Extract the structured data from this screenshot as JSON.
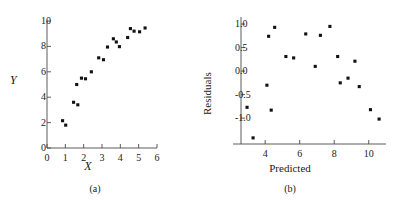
{
  "figure": {
    "background": "#ffffff",
    "marker_color": "#111111",
    "axis_color": "#4a4a4a"
  },
  "panels": [
    {
      "id": "a",
      "caption": "(a)",
      "chart_data": {
        "type": "scatter",
        "title": "",
        "xlabel": "X",
        "ylabel": "Y",
        "xlim": [
          0,
          6
        ],
        "ylim": [
          0,
          10
        ],
        "xticks": [
          0,
          1,
          2,
          3,
          4,
          5,
          6
        ],
        "xticklabels": [
          "0",
          "1",
          "2",
          "3",
          "4",
          "5",
          "6"
        ],
        "yticks": [
          0,
          2,
          4,
          6,
          8,
          10
        ],
        "yticklabels": [
          "0",
          "2",
          "4",
          "6",
          "8",
          "10"
        ],
        "grid": false,
        "legend": null,
        "points": [
          {
            "x": 0.85,
            "y": 2.15
          },
          {
            "x": 1.02,
            "y": 1.8
          },
          {
            "x": 1.45,
            "y": 3.6
          },
          {
            "x": 1.68,
            "y": 3.4
          },
          {
            "x": 1.62,
            "y": 5.0
          },
          {
            "x": 1.88,
            "y": 5.5
          },
          {
            "x": 2.1,
            "y": 5.45
          },
          {
            "x": 2.42,
            "y": 6.0
          },
          {
            "x": 2.82,
            "y": 7.1
          },
          {
            "x": 3.08,
            "y": 6.95
          },
          {
            "x": 3.3,
            "y": 7.95
          },
          {
            "x": 3.62,
            "y": 8.6
          },
          {
            "x": 3.78,
            "y": 8.35
          },
          {
            "x": 3.95,
            "y": 7.98
          },
          {
            "x": 4.4,
            "y": 8.7
          },
          {
            "x": 4.55,
            "y": 9.4
          },
          {
            "x": 4.75,
            "y": 9.2
          },
          {
            "x": 5.05,
            "y": 9.15
          },
          {
            "x": 5.35,
            "y": 9.45
          }
        ]
      }
    },
    {
      "id": "b",
      "caption": "(b)",
      "chart_data": {
        "type": "scatter",
        "title": "",
        "xlabel": "Predicted",
        "ylabel": "Residuals",
        "xlim": [
          2.6,
          11.0
        ],
        "ylim": [
          -1.55,
          1.15
        ],
        "xticks": [
          4,
          6,
          8,
          10
        ],
        "xticklabels": [
          "4",
          "6",
          "8",
          "10"
        ],
        "yticks": [
          -1.0,
          -0.5,
          0.0,
          0.5,
          1.0
        ],
        "yticklabels": [
          "-1.0",
          "-0.5",
          "0.0",
          "0.5",
          "1.0"
        ],
        "grid": false,
        "legend": null,
        "points": [
          {
            "x": 2.95,
            "y": -0.77
          },
          {
            "x": 3.3,
            "y": -1.42
          },
          {
            "x": 4.1,
            "y": -0.3
          },
          {
            "x": 4.2,
            "y": 0.74
          },
          {
            "x": 4.35,
            "y": -0.83
          },
          {
            "x": 4.55,
            "y": 0.93
          },
          {
            "x": 5.2,
            "y": 0.31
          },
          {
            "x": 5.65,
            "y": 0.28
          },
          {
            "x": 6.35,
            "y": 0.79
          },
          {
            "x": 6.9,
            "y": 0.1
          },
          {
            "x": 7.2,
            "y": 0.76
          },
          {
            "x": 7.75,
            "y": 0.95
          },
          {
            "x": 8.2,
            "y": 0.31
          },
          {
            "x": 8.35,
            "y": -0.25
          },
          {
            "x": 8.8,
            "y": -0.15
          },
          {
            "x": 9.2,
            "y": 0.21
          },
          {
            "x": 9.45,
            "y": -0.33
          },
          {
            "x": 10.1,
            "y": -0.82
          },
          {
            "x": 10.6,
            "y": -1.02
          }
        ]
      }
    }
  ]
}
